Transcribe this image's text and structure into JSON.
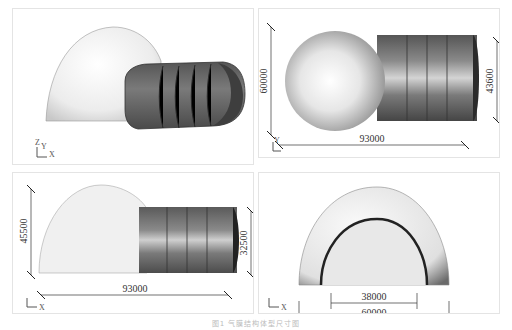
{
  "figure": {
    "caption": "图1  气膜结构体型尺寸图",
    "panels": [
      {
        "id": "perspective-view",
        "axis_labels": [
          "Z",
          "Y",
          "X"
        ]
      },
      {
        "id": "top-view",
        "axis_labels": [
          "Y",
          "Z",
          "X"
        ],
        "dims": {
          "overall_length": "93000",
          "dome_width": "60000",
          "tunnel_width": "43600"
        }
      },
      {
        "id": "side-view",
        "axis_labels": [
          "Y",
          "Z",
          "X"
        ],
        "dims": {
          "overall_length": "93000",
          "dome_height": "45500",
          "tunnel_height": "32500"
        }
      },
      {
        "id": "front-view",
        "axis_labels": [
          "Y",
          "Z",
          "X"
        ],
        "dims": {
          "tunnel_span": "38000",
          "dome_span": "60000"
        }
      }
    ]
  },
  "colors": {
    "dome": "#f0f0f0",
    "tunnel": "#707070",
    "line": "#333333",
    "frame": "#e4e4e4"
  }
}
